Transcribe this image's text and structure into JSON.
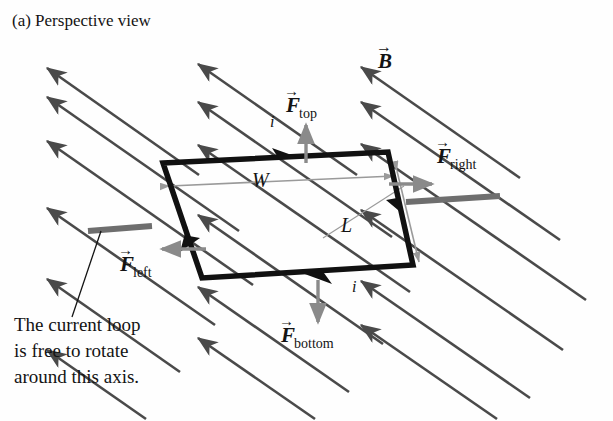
{
  "figure": {
    "part_label": "(a) Perspective view",
    "caption_lines": [
      "The current loop",
      "is free to rotate",
      "around this axis."
    ],
    "colors": {
      "field_line": "#4a4a4a",
      "loop": "#111111",
      "force_arrow": "#8a8a8a",
      "dimension_line": "#9a9a9a",
      "axis_rod": "#6e6e6e",
      "text": "#131313",
      "background": "#fefefe"
    },
    "field": {
      "vector_label": "B",
      "vector_label_overline": "→",
      "direction_degrees": -35,
      "line_count": 14
    },
    "loop": {
      "current_label_top": "i",
      "current_label_bottom": "i",
      "width_label": "W",
      "length_label": "L",
      "corners": {
        "top_left": [
          163,
          163
        ],
        "top_right": [
          388,
          152
        ],
        "bottom_right": [
          413,
          265
        ],
        "bottom_left": [
          202,
          278
        ]
      }
    },
    "forces": [
      {
        "name": "F-top",
        "base": "F",
        "sub": "top",
        "label_x": 286,
        "label_y": 112,
        "dir": "up"
      },
      {
        "name": "F-right",
        "base": "F",
        "sub": "right",
        "label_x": 437,
        "label_y": 163,
        "dir": "right"
      },
      {
        "name": "F-bottom",
        "base": "F",
        "sub": "bottom",
        "label_x": 281,
        "label_y": 342,
        "dir": "down"
      },
      {
        "name": "F-left",
        "base": "F",
        "sub": "left",
        "label_x": 120,
        "label_y": 271,
        "dir": "left"
      }
    ]
  }
}
